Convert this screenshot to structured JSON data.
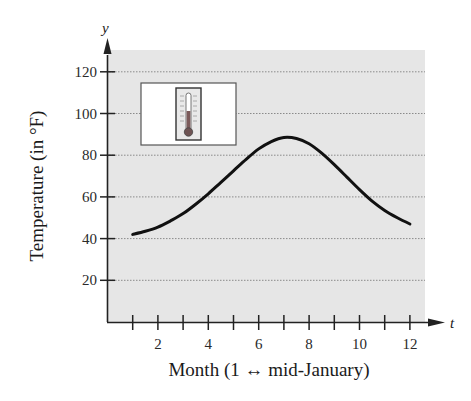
{
  "chart_data": {
    "type": "line",
    "title": "",
    "xlabel": "Month (1 ↔ mid-January)",
    "ylabel": "Temperature (in °F)",
    "x_axis_variable": "t",
    "y_axis_variable": "y",
    "xlim": [
      0,
      12.6
    ],
    "ylim": [
      0,
      130
    ],
    "x_ticks": [
      1,
      2,
      3,
      4,
      5,
      6,
      7,
      8,
      9,
      10,
      11,
      12
    ],
    "x_tick_labels": [
      "2",
      "4",
      "6",
      "8",
      "10",
      "12"
    ],
    "y_ticks": [
      20,
      40,
      60,
      80,
      100,
      120
    ],
    "y_tick_labels": [
      "20",
      "40",
      "60",
      "80",
      "100",
      "120"
    ],
    "grid": {
      "horizontal": true,
      "vertical": false,
      "style": "dotted"
    },
    "legend": null,
    "background_color": "#e6e6e6",
    "line_color": "#111111",
    "series": [
      {
        "name": "Temperature",
        "x": [
          1,
          1.5,
          2,
          2.5,
          3,
          3.5,
          4,
          4.5,
          5,
          5.5,
          6,
          6.5,
          7,
          7.5,
          8,
          8.5,
          9,
          9.5,
          10,
          10.5,
          11,
          11.5,
          12
        ],
        "values": [
          42,
          43.5,
          45.5,
          48.5,
          52,
          56.5,
          61.5,
          67,
          72.5,
          78,
          83,
          86.5,
          88.5,
          88,
          85.5,
          81,
          75.5,
          69.5,
          63.5,
          58,
          53.5,
          50,
          47
        ]
      }
    ],
    "annotations": [
      {
        "type": "inset-image",
        "depicts": "thermometer"
      }
    ]
  },
  "labels": {
    "y_axis_var": "y",
    "x_axis_var": "t",
    "xlabel": "Month (1 ↔ mid-January)",
    "ylabel": "Temperature (in °F)",
    "y_ticks": [
      "20",
      "40",
      "60",
      "80",
      "100",
      "120"
    ],
    "x_ticks": [
      "2",
      "4",
      "6",
      "8",
      "10",
      "12"
    ]
  }
}
